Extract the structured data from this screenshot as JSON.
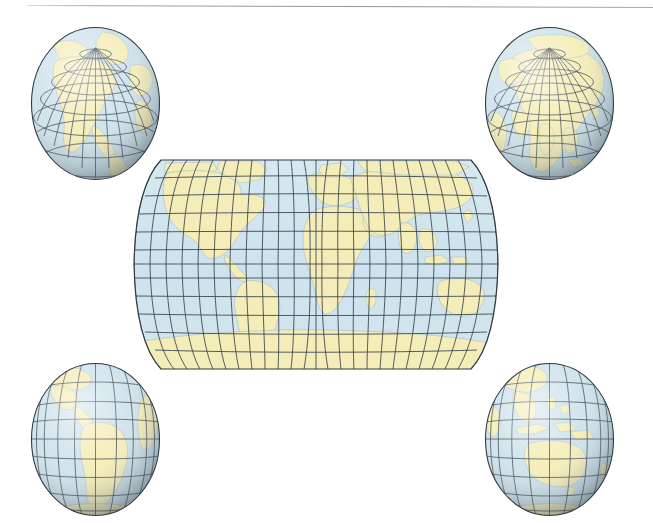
{
  "figure": {
    "background_color": "#ffffff",
    "width": 653,
    "height": 523
  },
  "palette": {
    "ocean": "#cfe3ec",
    "ocean_light": "#dceaf1",
    "land": "#f5edb8",
    "land_light": "#faf5d4",
    "graticule": "#3f4a52",
    "coastline": "#7fa2b4",
    "outline": "#2f3a42",
    "shadow": "#707c84",
    "highlight": "#ffffff",
    "scan_line": "#9b9b9b"
  },
  "scan_artifact": {
    "name": "page-edge-line",
    "x": 27,
    "y": 5,
    "width": 626,
    "color": "#9b9b9b"
  },
  "world_map": {
    "name": "robinson-world-map",
    "projection": "pseudocylindrical",
    "x": 125,
    "y": 157,
    "width": 382,
    "height": 215,
    "graticule_interval_degrees": 15,
    "meridian_count": 25,
    "parallel_count": 11,
    "lon_range": [
      -180,
      180
    ],
    "lat_range": [
      -90,
      90
    ],
    "center_meridian": 0,
    "landmasses": [
      "North America",
      "South America",
      "Europe",
      "Africa",
      "Asia",
      "Australia",
      "Antarctica",
      "Greenland"
    ]
  },
  "globes": [
    {
      "name": "globe-north-america",
      "position": "top-left",
      "x": 30,
      "y": 26,
      "width": 131,
      "height": 155,
      "center_lat": 45,
      "center_lon": -100,
      "featured_region": "North America",
      "graticule_interval_degrees": 15
    },
    {
      "name": "globe-asia",
      "position": "top-right",
      "x": 484,
      "y": 26,
      "width": 131,
      "height": 155,
      "center_lat": 45,
      "center_lon": 80,
      "featured_region": "Asia",
      "graticule_interval_degrees": 15
    },
    {
      "name": "globe-south-america",
      "position": "bottom-left",
      "x": 30,
      "y": 362,
      "width": 131,
      "height": 155,
      "center_lat": -15,
      "center_lon": -60,
      "featured_region": "South America",
      "graticule_interval_degrees": 15
    },
    {
      "name": "globe-australia",
      "position": "bottom-right",
      "x": 484,
      "y": 362,
      "width": 131,
      "height": 155,
      "center_lat": -20,
      "center_lon": 130,
      "featured_region": "Australia and Oceania",
      "graticule_interval_degrees": 15
    }
  ],
  "chart_data": {
    "type": "map",
    "panels": [
      {
        "label": "North America",
        "view": "orthographic",
        "center": [
          45,
          -100
        ]
      },
      {
        "label": "Asia",
        "view": "orthographic",
        "center": [
          45,
          80
        ]
      },
      {
        "label": "World",
        "view": "pseudocylindrical",
        "center": [
          0,
          0
        ]
      },
      {
        "label": "South America",
        "view": "orthographic",
        "center": [
          -15,
          -60
        ]
      },
      {
        "label": "Australia and Oceania",
        "view": "orthographic",
        "center": [
          -20,
          130
        ]
      }
    ],
    "graticule_interval_degrees": 15,
    "legend": []
  }
}
